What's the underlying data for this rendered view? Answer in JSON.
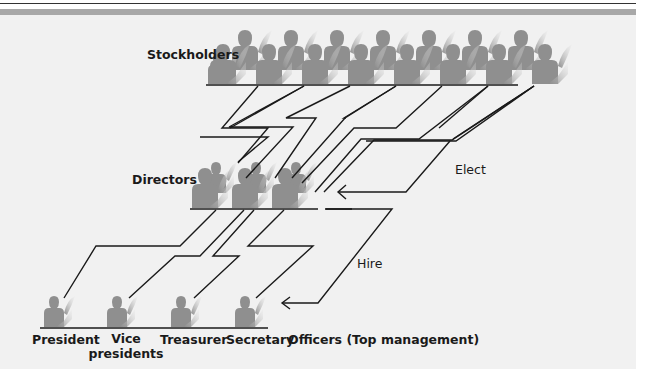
{
  "diagram": {
    "type": "corporate-governance-structure",
    "groups": {
      "stockholders": {
        "label": "Stockholders"
      },
      "directors": {
        "label": "Directors"
      },
      "officers": {
        "label": "Officers (Top management)"
      }
    },
    "officers": [
      {
        "label": "President"
      },
      {
        "label": "Vice presidents",
        "line1": "Vice",
        "line2": "presidents"
      },
      {
        "label": "Treasurer"
      },
      {
        "label": "Secretary"
      }
    ],
    "relations": [
      {
        "from": "Stockholders",
        "to": "Directors",
        "label": "Elect"
      },
      {
        "from": "Directors",
        "to": "Officers",
        "label": "Hire"
      }
    ],
    "colors": {
      "figure": "#8f8f8f",
      "figure_shadow": "#b5b5b5",
      "line": "#1a1a1a",
      "panel": "#f1f1f1",
      "band": "#a8a8a8"
    }
  }
}
